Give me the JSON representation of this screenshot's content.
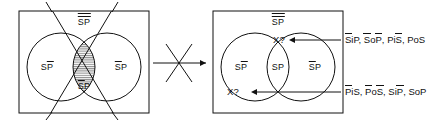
{
  "figure": {
    "type": "logic-venn-diagram-pair",
    "relation_symbol": "crossed-arrow-does-not-imply",
    "left_diagram": {
      "name": "left-venn",
      "universe_label": {
        "text": "SP",
        "bars": 2
      },
      "left_region_label": {
        "text_s": "S",
        "text_p": "P",
        "bar_over": "P"
      },
      "right_region_label": {
        "text_s": "S",
        "text_p": "P",
        "bar_over": "S"
      },
      "center_region_label": {
        "text_s": "S",
        "text_p": "P",
        "bar_over": "S"
      },
      "shaded_region": "intersection",
      "has_x_cross_overlay": true
    },
    "right_diagram": {
      "name": "right-venn",
      "universe_label": {
        "text": "SP",
        "bars": 2
      },
      "left_region_label": {
        "text_s": "S",
        "text_p": "P",
        "bar_over": "P"
      },
      "center_region_label": {
        "text_s": "S",
        "text_p": "P",
        "bar_over": "none"
      },
      "right_region_label": {
        "text_s": "S",
        "text_p": "P",
        "bar_over": "S"
      },
      "markers": [
        {
          "id": "marker-top",
          "label": "X?"
        },
        {
          "id": "marker-bottom",
          "label": "X?"
        }
      ]
    },
    "annotations": [
      {
        "id": "annotation-top",
        "items": [
          {
            "prefix": "",
            "bar": "S",
            "mid": "iP",
            "post": ""
          },
          {
            "prefix": "",
            "bar": "S",
            "mid": "oP",
            "post": "bar-P"
          },
          {
            "prefix": "Pi",
            "bar": "S",
            "mid": "",
            "post": ""
          },
          {
            "prefix": "PoS",
            "bar": "",
            "mid": "",
            "post": ""
          }
        ],
        "plain": "SiP, SoP, PiS, PoS"
      },
      {
        "id": "annotation-bottom",
        "items": [
          {
            "prefix": "",
            "bar": "P",
            "mid": "iS",
            "post": ""
          },
          {
            "prefix": "",
            "bar": "P",
            "mid": "oS",
            "post": "bar-S"
          },
          {
            "prefix": "Si",
            "bar": "P",
            "mid": "",
            "post": ""
          },
          {
            "prefix": "SoP",
            "bar": "",
            "mid": "",
            "post": ""
          }
        ],
        "plain": "PiS, PoS, SiP, SoP"
      }
    ],
    "colors": {
      "stroke": "#111111",
      "background": "#ffffff",
      "shading": "#c9c9c9"
    }
  },
  "glyphs": {
    "S": "S",
    "P": "P",
    "i": "i",
    "o": "o",
    "comma": ", ",
    "x_question": "X?"
  }
}
